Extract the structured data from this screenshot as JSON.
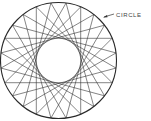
{
  "diagram": {
    "label": "CIRCLE",
    "points_on_circle": 24,
    "chord_step": 9,
    "line_color": "#333333",
    "background": "#ffffff"
  }
}
